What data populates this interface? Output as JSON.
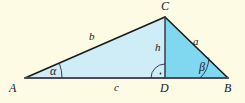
{
  "figure": {
    "kind": "geometry-diagram",
    "colors": {
      "background": "#FDFBE3",
      "left_triangle_fill": "#CEEDF7",
      "right_triangle_fill": "#7FD8EF",
      "stroke": "#1A1A1A",
      "base_stroke": "#4A4A5A",
      "label_color": "#1A1A1A"
    },
    "points": {
      "A": {
        "label": "A",
        "x": 25,
        "y": 78
      },
      "B": {
        "label": "B",
        "x": 228,
        "y": 78
      },
      "C": {
        "label": "C",
        "x": 165,
        "y": 17
      },
      "D": {
        "label": "D",
        "x": 165,
        "y": 78
      }
    },
    "vertex_labels": [
      {
        "name": "vertex-label-A",
        "text": "A",
        "x": 9,
        "y": 82
      },
      {
        "name": "vertex-label-B",
        "text": "B",
        "x": 224,
        "y": 82
      },
      {
        "name": "vertex-label-C",
        "text": "C",
        "x": 161,
        "y": 0
      },
      {
        "name": "vertex-label-D",
        "text": "D",
        "x": 160,
        "y": 82
      }
    ],
    "side_labels": [
      {
        "name": "side-label-b",
        "text": "b",
        "x": 89,
        "y": 31
      },
      {
        "name": "side-label-a",
        "text": "a",
        "x": 193,
        "y": 36
      },
      {
        "name": "side-label-c",
        "text": "c",
        "x": 114,
        "y": 82
      },
      {
        "name": "side-label-h",
        "text": "h",
        "x": 155,
        "y": 42
      }
    ],
    "angle_labels": [
      {
        "name": "angle-label-alpha",
        "text": "α",
        "x": 50,
        "y": 65
      },
      {
        "name": "angle-label-beta",
        "text": "β",
        "x": 199,
        "y": 61
      }
    ],
    "markers": {
      "right_angle": {
        "name": "right-angle-marker-at-D",
        "at": "D",
        "style": "arc-with-dot"
      },
      "alpha_arc": {
        "name": "angle-arc-alpha",
        "at": "A"
      },
      "beta_arc": {
        "name": "angle-arc-beta",
        "at": "B"
      }
    }
  }
}
